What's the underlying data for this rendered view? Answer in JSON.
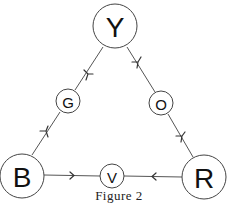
{
  "figure": {
    "caption": "Figure 2",
    "nodes": {
      "top": {
        "label": "Y"
      },
      "bottom_left": {
        "label": "B"
      },
      "bottom_right": {
        "label": "R"
      },
      "left_mid": {
        "label": "G"
      },
      "right_mid": {
        "label": "O"
      },
      "bottom_mid": {
        "label": "V"
      }
    },
    "edges": [
      {
        "from": "Y",
        "to": "G",
        "arrow": "toward G"
      },
      {
        "from": "B",
        "to": "G",
        "arrow": "toward G"
      },
      {
        "from": "Y",
        "to": "O",
        "arrow": "toward O"
      },
      {
        "from": "O",
        "to": "R",
        "arrow": "toward R"
      },
      {
        "from": "B",
        "to": "V",
        "arrow": "toward V"
      },
      {
        "from": "R",
        "to": "V",
        "arrow": "toward V"
      }
    ],
    "colors": {
      "stroke": "#444444",
      "text": "#111111",
      "background": "#ffffff"
    }
  }
}
